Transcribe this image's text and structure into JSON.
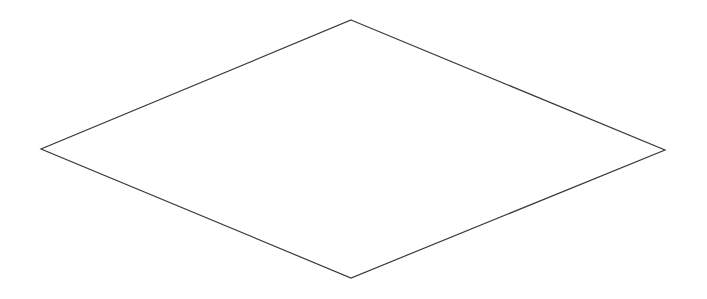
{
  "canvas": {
    "width": 707,
    "height": 299,
    "background": "#ffffff"
  },
  "shape": {
    "type": "diamond",
    "label": "",
    "stroke": "#3a3a3a",
    "stroke_width": 1.2,
    "fill": "#ffffff",
    "vertices": {
      "top": [
        351,
        20
      ],
      "right": [
        665,
        150
      ],
      "bottom": [
        351,
        278
      ],
      "left": [
        41,
        149
      ]
    }
  }
}
